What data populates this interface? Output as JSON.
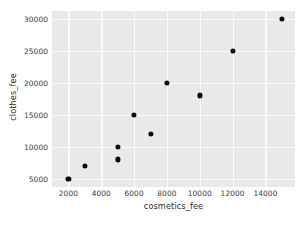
{
  "chart_data": {
    "type": "scatter",
    "title": "",
    "xlabel": "cosmetics_fee",
    "ylabel": "clothes_fee",
    "xlim": [
      1000,
      15800
    ],
    "ylim": [
      3700,
      31200
    ],
    "xticks": [
      2000,
      4000,
      6000,
      8000,
      10000,
      12000,
      14000
    ],
    "yticks": [
      5000,
      10000,
      15000,
      20000,
      25000,
      30000
    ],
    "xtick_labels": [
      "2000",
      "4000",
      "6000",
      "8000",
      "10000",
      "12000",
      "14000"
    ],
    "ytick_labels": [
      "5000",
      "10000",
      "15000",
      "20000",
      "25000",
      "30000"
    ],
    "grid": true,
    "legend": null,
    "series": [
      {
        "name": "points",
        "marker": "circle",
        "color": "#0b0b0b",
        "points": [
          {
            "x": 2000,
            "y": 5000
          },
          {
            "x": 3000,
            "y": 7000
          },
          {
            "x": 5000,
            "y": 8000
          },
          {
            "x": 5000,
            "y": 10000
          },
          {
            "x": 6000,
            "y": 15000
          },
          {
            "x": 7000,
            "y": 12000
          },
          {
            "x": 8000,
            "y": 20000
          },
          {
            "x": 10000,
            "y": 18000
          },
          {
            "x": 12000,
            "y": 25000
          },
          {
            "x": 15000,
            "y": 30000
          }
        ]
      }
    ],
    "style": {
      "panel_background": "#e9e9e9",
      "grid_color": "#fafafa",
      "figure_background": "#ffffff",
      "tick_color": "#3b3b3b"
    }
  }
}
